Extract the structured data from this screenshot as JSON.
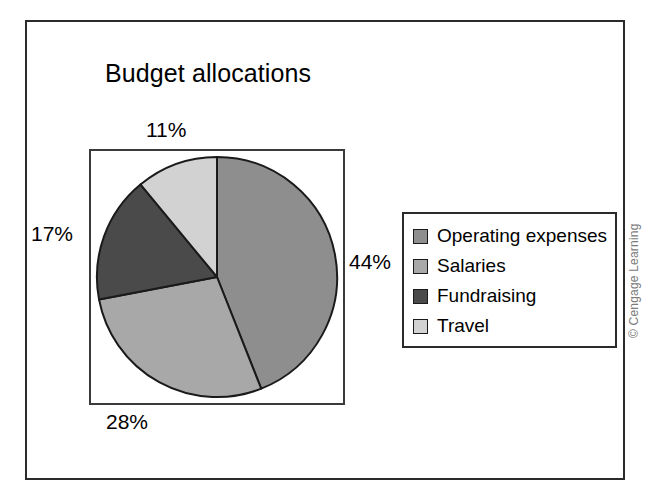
{
  "chart_data": {
    "type": "pie",
    "title": "Budget allocations",
    "categories": [
      "Operating expenses",
      "Salaries",
      "Fundraising",
      "Travel"
    ],
    "values": [
      44,
      28,
      17,
      11
    ],
    "value_labels": [
      "44%",
      "28%",
      "17%",
      "11%"
    ],
    "unit": "%",
    "start_angle_deg": 0,
    "direction": "clockwise",
    "legend_position": "right",
    "grid": false,
    "colors": [
      "#8e8e8e",
      "#a8a8a8",
      "#4a4a4a",
      "#d2d2d2"
    ],
    "slice_border_color": "#1a1a1a",
    "xlabel": "",
    "ylabel": ""
  },
  "labels": {
    "top": "11%",
    "right": "44%",
    "bottom": "28%",
    "left": "17%"
  },
  "legend": {
    "items": [
      {
        "label": "Operating expenses",
        "color": "#8e8e8e"
      },
      {
        "label": "Salaries",
        "color": "#a8a8a8"
      },
      {
        "label": "Fundraising",
        "color": "#4a4a4a"
      },
      {
        "label": "Travel",
        "color": "#d2d2d2"
      }
    ]
  },
  "credit": {
    "text": "© Cengage Learning"
  }
}
